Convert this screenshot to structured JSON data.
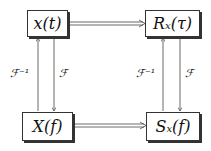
{
  "nodes": {
    "tl": {
      "label": "x(t)"
    },
    "tr": {
      "label": "Rₓ(τ)"
    },
    "bl": {
      "label": "X(f)"
    },
    "br": {
      "label": "Sₓ(f)"
    }
  },
  "edges": {
    "left_up": "ℱ⁻¹",
    "left_down": "ℱ",
    "right_up": "ℱ⁻¹",
    "right_down": "ℱ"
  }
}
